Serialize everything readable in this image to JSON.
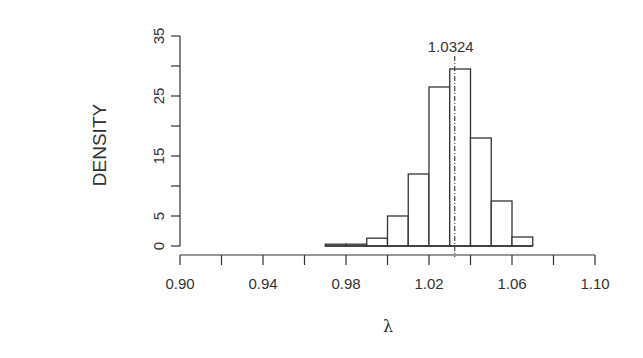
{
  "chart_data": {
    "type": "bar",
    "subtype": "histogram",
    "title": "",
    "xlabel": "λ",
    "ylabel": "DENSITY",
    "xlim": [
      0.9,
      1.1
    ],
    "ylim": [
      0,
      35
    ],
    "x_ticks": [
      0.9,
      0.92,
      0.94,
      0.96,
      0.98,
      1.0,
      1.02,
      1.04,
      1.06,
      1.08,
      1.1
    ],
    "x_tick_labels": [
      "0.90",
      "",
      "0.94",
      "",
      "0.98",
      "",
      "1.02",
      "",
      "1.06",
      "",
      "1.10"
    ],
    "y_ticks": [
      0,
      5,
      10,
      15,
      20,
      25,
      30,
      35
    ],
    "y_tick_labels": [
      "0",
      "5",
      "",
      "15",
      "",
      "25",
      "",
      "35"
    ],
    "bin_width": 0.01,
    "bins": [
      {
        "start": 0.97,
        "end": 0.98,
        "density": 0.3
      },
      {
        "start": 0.98,
        "end": 0.99,
        "density": 0.3
      },
      {
        "start": 0.99,
        "end": 1.0,
        "density": 1.3
      },
      {
        "start": 1.0,
        "end": 1.01,
        "density": 5.0
      },
      {
        "start": 1.01,
        "end": 1.02,
        "density": 12.0
      },
      {
        "start": 1.02,
        "end": 1.03,
        "density": 26.5
      },
      {
        "start": 1.03,
        "end": 1.04,
        "density": 29.5
      },
      {
        "start": 1.04,
        "end": 1.05,
        "density": 18.0
      },
      {
        "start": 1.05,
        "end": 1.06,
        "density": 7.5
      },
      {
        "start": 1.06,
        "end": 1.07,
        "density": 1.5
      }
    ],
    "categories": [
      "0.97",
      "0.98",
      "0.99",
      "1.00",
      "1.01",
      "1.02",
      "1.03",
      "1.04",
      "1.05",
      "1.06"
    ],
    "values": [
      0.3,
      0.3,
      1.3,
      5.0,
      12.0,
      26.5,
      29.5,
      18.0,
      7.5,
      1.5
    ],
    "reference_line": {
      "x": 1.0324,
      "style": "dash-dot",
      "label": "1.0324"
    },
    "grid": false,
    "legend": null
  },
  "labels": {
    "ylabel": "DENSITY",
    "xlabel": "λ",
    "annotation": "1.0324"
  },
  "colors": {
    "ink": "#333333",
    "bar_fill": "#ffffff",
    "background": "#ffffff"
  }
}
